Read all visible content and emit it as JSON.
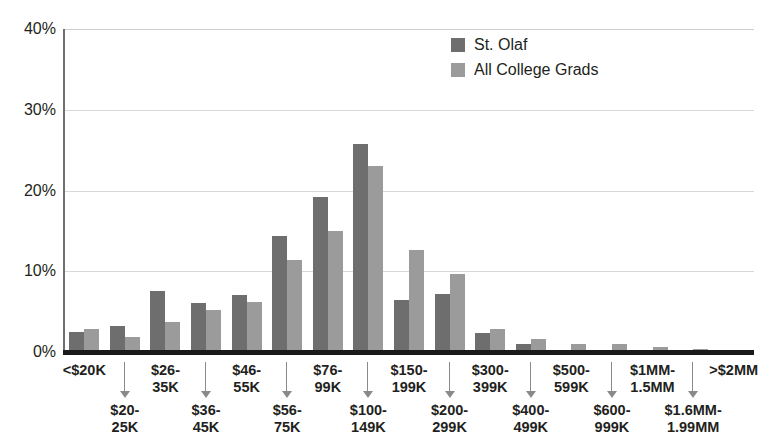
{
  "chart_data": {
    "type": "bar",
    "title": "",
    "xlabel": "",
    "ylabel": "",
    "ylim": [
      0,
      40
    ],
    "yticks": [
      0,
      10,
      20,
      30,
      40
    ],
    "ytick_labels": [
      "0%",
      "10%",
      "20%",
      "30%",
      "40%"
    ],
    "grid": true,
    "legend_position": "top-right",
    "categories": [
      "<$20K",
      "$20-25K",
      "$26-35K",
      "$36-45K",
      "$46-55K",
      "$56-75K",
      "$76-99K",
      "$100-149K",
      "$150-199K",
      "$200-299K",
      "$300-399K",
      "$400-499K",
      "$500-599K",
      "$600-999K",
      "$1MM-1.5MM",
      "$1.6MM-1.99MM",
      ">$2MM"
    ],
    "category_rows": [
      "upper",
      "lower",
      "upper",
      "lower",
      "upper",
      "lower",
      "upper",
      "lower",
      "upper",
      "lower",
      "upper",
      "lower",
      "upper",
      "lower",
      "upper",
      "lower",
      "upper"
    ],
    "series": [
      {
        "name": "St. Olaf",
        "color": "#6e6e6e",
        "values": [
          2.5,
          3.2,
          7.6,
          6.1,
          7.0,
          14.4,
          19.2,
          25.8,
          6.4,
          7.2,
          2.3,
          1.0,
          0.0,
          0.0,
          0.0,
          0.0,
          0.0
        ]
      },
      {
        "name": "All College Grads",
        "color": "#9b9b9b",
        "values": [
          2.9,
          1.8,
          3.7,
          5.2,
          6.2,
          11.4,
          15.0,
          23.0,
          12.6,
          9.7,
          2.9,
          1.6,
          1.0,
          1.0,
          0.6,
          0.4,
          0.0
        ]
      }
    ]
  },
  "legend": {
    "items": [
      {
        "label": "St. Olaf",
        "color": "#6e6e6e"
      },
      {
        "label": "All College Grads",
        "color": "#9b9b9b"
      }
    ]
  },
  "colors": {
    "series_dark": "#6e6e6e",
    "series_light": "#9b9b9b",
    "axis": "#1a1a1a",
    "gridline": "#d8d8d8",
    "text": "#231f20"
  }
}
